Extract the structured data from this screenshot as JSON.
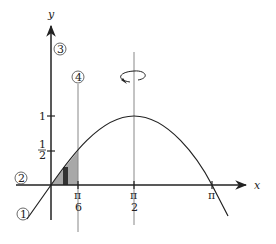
{
  "diagram": {
    "axes": {
      "x_label": "x",
      "y_label": "y"
    },
    "x_ticks": [
      {
        "num": "π",
        "den": "6"
      },
      {
        "num": "π",
        "den": "2"
      },
      {
        "num": "π",
        "den": ""
      }
    ],
    "y_ticks": [
      {
        "label": "1"
      },
      {
        "num": "1",
        "den": "2"
      }
    ],
    "markers": [
      "1",
      "2",
      "3",
      "4"
    ],
    "curve": "y = sin x, shaded region from 0 to π/6, rotation about x = π/2",
    "colors": {
      "line": "#222222",
      "shade": "#a8a8a8",
      "strip": "#333333",
      "guide": "#888888"
    }
  }
}
